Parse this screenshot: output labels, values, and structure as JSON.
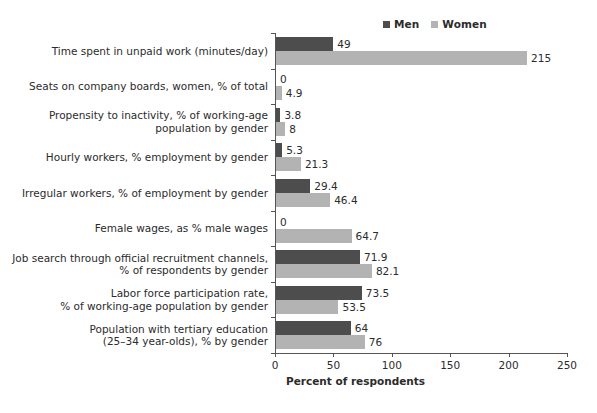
{
  "chart_data": {
    "type": "bar",
    "orientation": "horizontal",
    "title": "",
    "xlabel": "Percent of respondents",
    "ylabel": "",
    "xlim": [
      0,
      250
    ],
    "xticks": [
      0,
      50,
      100,
      150,
      200,
      250
    ],
    "grid": false,
    "legend_position": "top-right",
    "categories": [
      "Time spent in unpaid work (minutes/day)",
      "Seats on company boards, women, % of total",
      "Propensity to inactivity, % of working-age\npopulation by gender",
      "Hourly workers, % employment by gender",
      "Irregular workers, % of employment by gender",
      "Female wages, as % male wages",
      "Job search through official recruitment channels,\n% of respondents by gender",
      "Labor force participation rate,\n% of working-age population by gender",
      "Population with tertiary education\n(25–34 year-olds), % by gender"
    ],
    "series": [
      {
        "name": "Men",
        "color": "#4d4d4d",
        "values": [
          49,
          0,
          3.8,
          5.3,
          29.4,
          0,
          71.9,
          73.5,
          64
        ],
        "labels": [
          "49",
          "0",
          "3.8",
          "5.3",
          "29.4",
          "0",
          "71.9",
          "73.5",
          "64"
        ]
      },
      {
        "name": "Women",
        "color": "#b3b3b3",
        "values": [
          215,
          4.9,
          8,
          21.3,
          46.4,
          64.7,
          82.1,
          53.5,
          76
        ],
        "labels": [
          "215",
          "4.9",
          "8",
          "21.3",
          "46.4",
          "64.7",
          "82.1",
          "53.5",
          "76"
        ]
      }
    ]
  },
  "colors": {
    "men": "#4d4d4d",
    "women": "#b3b3b3",
    "axis": "#555555",
    "text": "#2b2b2b",
    "background": "#ffffff"
  }
}
